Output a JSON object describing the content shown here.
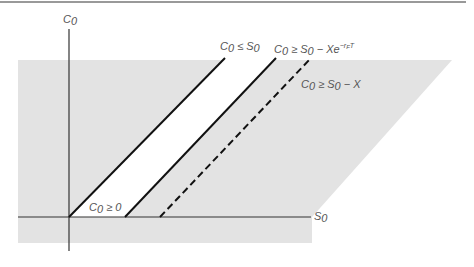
{
  "figure": {
    "type": "option-price-bounds-diagram",
    "colors": {
      "feasible_region": "#e3e3e3",
      "excluded_band": "#ffffff",
      "bound_line": "#111111",
      "axis": "#333333",
      "label": "#555555",
      "top_rule": "#777777"
    },
    "axes": {
      "y_label": {
        "base": "C",
        "sub": "0"
      },
      "x_label": {
        "base": "S",
        "sub": "0"
      }
    },
    "labels": {
      "upper_bound": {
        "lhs": "C",
        "lhs_sub": "0",
        "op": " ≤ ",
        "rhs": "S",
        "rhs_sub": "0",
        "tail": ""
      },
      "lower_bound_pv": {
        "lhs": "C",
        "lhs_sub": "0",
        "op": " ≥ ",
        "rhs": "S",
        "rhs_sub": "0",
        "tail": " − Xe",
        "sup": "−r",
        "sup_sub": "F",
        "sup_tail": "T"
      },
      "lower_bound_intrinsic": {
        "lhs": "C",
        "lhs_sub": "0",
        "op": " ≥ ",
        "rhs": "S",
        "rhs_sub": "0",
        "tail": " − X"
      },
      "nonneg": {
        "lhs": "C",
        "lhs_sub": "0",
        "op": " ≥ ",
        "rhs": "0"
      }
    },
    "lines": [
      {
        "name": "upper-bound-line",
        "style": "solid",
        "from": [
          69,
          217
        ],
        "to": [
          225,
          58
        ]
      },
      {
        "name": "lower-bound-pv-line",
        "style": "solid",
        "from": [
          125,
          217
        ],
        "to": [
          276,
          58
        ]
      },
      {
        "name": "lower-bound-intrinsic-line",
        "style": "dashed",
        "from": [
          160,
          217
        ],
        "to": [
          311,
          58
        ]
      }
    ]
  }
}
